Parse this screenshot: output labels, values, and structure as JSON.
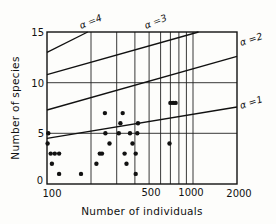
{
  "chart_data": {
    "type": "scatter",
    "title": "",
    "xlabel": "Number of individuals",
    "ylabel": "Number of species",
    "x_scale": "log",
    "xlim": [
      100,
      2000
    ],
    "ylim": [
      0,
      15
    ],
    "x_ticks": [
      100,
      500,
      1000,
      2000
    ],
    "x_tick_labels": [
      "100",
      "500",
      "1000",
      "2000"
    ],
    "y_ticks": [
      0,
      5,
      10,
      15
    ],
    "y_tick_labels": [
      "0",
      "5",
      "10",
      "15"
    ],
    "grid": {
      "vertical_at": [
        200,
        300,
        400,
        500,
        600,
        700,
        800,
        900,
        1000
      ],
      "horizontal_at": [
        5,
        10
      ]
    },
    "legend": null,
    "reference_curves": [
      {
        "name": "α=1",
        "label": "α =1",
        "points": [
          [
            100,
            4.5
          ],
          [
            2000,
            7.6
          ]
        ]
      },
      {
        "name": "α=2",
        "label": "α =2",
        "points": [
          [
            100,
            7.3
          ],
          [
            2000,
            12.6
          ]
        ]
      },
      {
        "name": "α=3",
        "label": "α =3",
        "points": [
          [
            100,
            10.8
          ],
          [
            1090,
            15
          ]
        ]
      },
      {
        "name": "α=4",
        "label": "α =4",
        "points": [
          [
            100,
            13.0
          ],
          [
            190,
            15
          ]
        ]
      }
    ],
    "series": [
      {
        "name": "observations",
        "points": [
          [
            102,
            5
          ],
          [
            101,
            4
          ],
          [
            106,
            3
          ],
          [
            108,
            2
          ],
          [
            113,
            3
          ],
          [
            121,
            3
          ],
          [
            121,
            1
          ],
          [
            171,
            1
          ],
          [
            218,
            2
          ],
          [
            230,
            3
          ],
          [
            238,
            3
          ],
          [
            249,
            7
          ],
          [
            251,
            5
          ],
          [
            268,
            4
          ],
          [
            310,
            5
          ],
          [
            318,
            6
          ],
          [
            330,
            7
          ],
          [
            340,
            3
          ],
          [
            350,
            2
          ],
          [
            370,
            5
          ],
          [
            385,
            4
          ],
          [
            405,
            3
          ],
          [
            415,
            5
          ],
          [
            405,
            1
          ],
          [
            420,
            6
          ],
          [
            690,
            4
          ],
          [
            700,
            8
          ],
          [
            730,
            8
          ],
          [
            760,
            8
          ]
        ]
      }
    ]
  },
  "labels": {
    "xlabel": "Number of individuals",
    "ylabel": "Number of species",
    "alpha1": "α =1",
    "alpha2": "α =2",
    "alpha3": "α =3",
    "alpha4": "α =4",
    "x100": "100",
    "x500": "500",
    "x1000": "1000",
    "x2000": "2000",
    "y0": "0",
    "y5": "5",
    "y10": "10",
    "y15": "15"
  }
}
